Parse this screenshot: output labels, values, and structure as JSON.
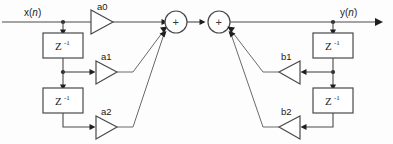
{
  "diagram": {
    "type": "block-diagram",
    "background_color": "#fdfdfd",
    "line_color": "#4a4a4a",
    "text_color": "#1a1a1a",
    "input": {
      "label_prefix": "x(",
      "label_var": "n",
      "label_suffix": ")",
      "label_full": "x(n)"
    },
    "output": {
      "label_prefix": "y(",
      "label_var": "n",
      "label_suffix": ")",
      "label_full": "y(n)"
    },
    "delay_blocks": [
      {
        "id": "delay-ff-1",
        "base": "Z",
        "exponent": "-1",
        "side": "feedforward"
      },
      {
        "id": "delay-ff-2",
        "base": "Z",
        "exponent": "-1",
        "side": "feedforward"
      },
      {
        "id": "delay-fb-1",
        "base": "Z",
        "exponent": "-1",
        "side": "feedback"
      },
      {
        "id": "delay-fb-2",
        "base": "Z",
        "exponent": "-1",
        "side": "feedback"
      }
    ],
    "gains": [
      {
        "id": "gain-a0",
        "label": "a0",
        "direction": "right",
        "side": "feedforward"
      },
      {
        "id": "gain-a1",
        "label": "a1",
        "direction": "right",
        "side": "feedforward"
      },
      {
        "id": "gain-a2",
        "label": "a2",
        "direction": "right",
        "side": "feedforward"
      },
      {
        "id": "gain-b1",
        "label": "b1",
        "direction": "left",
        "side": "feedback"
      },
      {
        "id": "gain-b2",
        "label": "b2",
        "direction": "left",
        "side": "feedback"
      }
    ],
    "adders": [
      {
        "id": "adder-left",
        "symbol": "+"
      },
      {
        "id": "adder-right",
        "symbol": "+"
      }
    ]
  }
}
